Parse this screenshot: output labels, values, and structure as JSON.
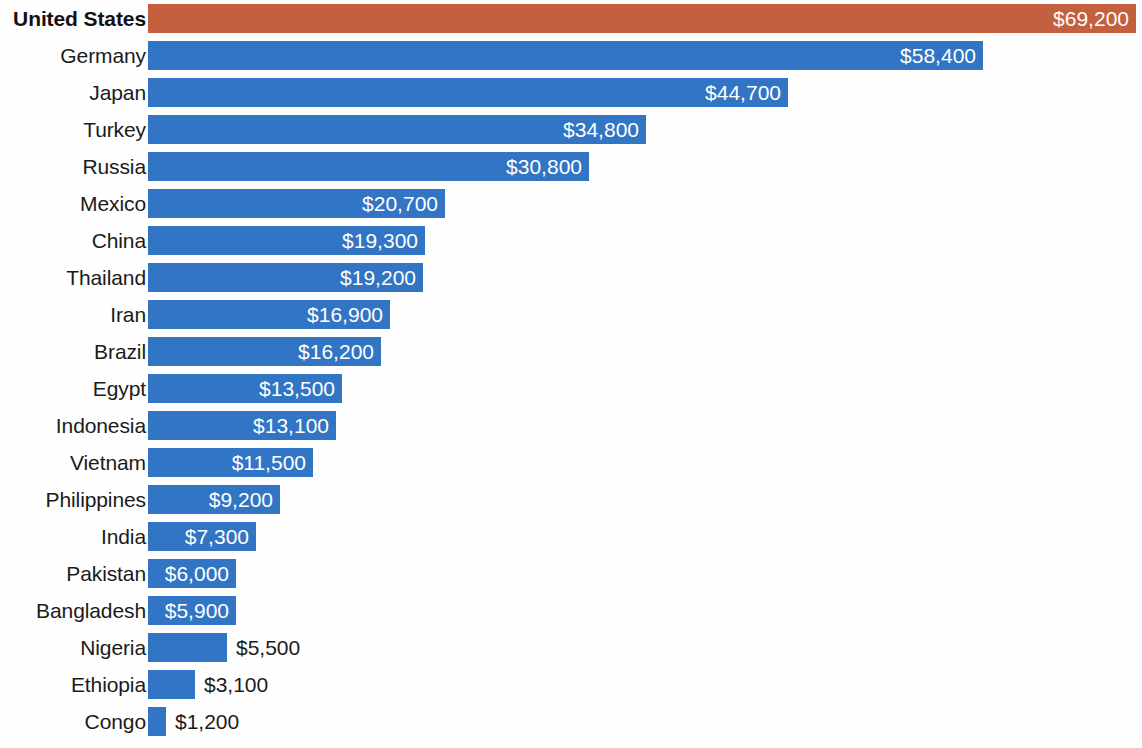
{
  "chart_data": {
    "type": "bar",
    "orientation": "horizontal",
    "title": "",
    "subtitle": "",
    "xlabel": "",
    "ylabel": "",
    "grid": false,
    "legend": null,
    "axis_visible": false,
    "value_prefix": "$",
    "xlim": [
      0,
      69200
    ],
    "colors": {
      "bar": "#3175c4",
      "highlight_bar": "#c5603f",
      "inside_label": "#ffffff",
      "outside_label": "#1b1b1b",
      "background": "#fefefe"
    },
    "highlight_category": "United States",
    "categories": [
      "United States",
      "Germany",
      "Japan",
      "Turkey",
      "Russia",
      "Mexico",
      "China",
      "Thailand",
      "Iran",
      "Brazil",
      "Egypt",
      "Indonesia",
      "Vietnam",
      "Philippines",
      "India",
      "Pakistan",
      "Bangladesh",
      "Nigeria",
      "Ethiopia",
      "Congo"
    ],
    "values": [
      69200,
      58400,
      44700,
      34800,
      30800,
      20700,
      19300,
      19200,
      16900,
      16200,
      13500,
      13100,
      11500,
      9200,
      7300,
      6000,
      5900,
      5500,
      3100,
      1200
    ],
    "value_labels": [
      "$69,200",
      "$58,400",
      "$44,700",
      "$34,800",
      "$30,800",
      "$20,700",
      "$19,300",
      "$19,200",
      "$16,900",
      "$16,200",
      "$13,500",
      "$13,100",
      "$11,500",
      "$9,200",
      "$7,300",
      "$6,000",
      "$5,900",
      "$5,500",
      "$3,100",
      "$1,200"
    ]
  },
  "rows": [
    {
      "label": "United States",
      "value": 69200,
      "value_label": "$69,200",
      "bar_px": 988,
      "label_inside": true,
      "highlight": true
    },
    {
      "label": "Germany",
      "value": 58400,
      "value_label": "$58,400",
      "bar_px": 835,
      "label_inside": true,
      "highlight": false
    },
    {
      "label": "Japan",
      "value": 44700,
      "value_label": "$44,700",
      "bar_px": 640,
      "label_inside": true,
      "highlight": false
    },
    {
      "label": "Turkey",
      "value": 34800,
      "value_label": "$34,800",
      "bar_px": 498,
      "label_inside": true,
      "highlight": false
    },
    {
      "label": "Russia",
      "value": 30800,
      "value_label": "$30,800",
      "bar_px": 441,
      "label_inside": true,
      "highlight": false
    },
    {
      "label": "Mexico",
      "value": 20700,
      "value_label": "$20,700",
      "bar_px": 297,
      "label_inside": true,
      "highlight": false
    },
    {
      "label": "China",
      "value": 19300,
      "value_label": "$19,300",
      "bar_px": 277,
      "label_inside": true,
      "highlight": false
    },
    {
      "label": "Thailand",
      "value": 19200,
      "value_label": "$19,200",
      "bar_px": 275,
      "label_inside": true,
      "highlight": false
    },
    {
      "label": "Iran",
      "value": 16900,
      "value_label": "$16,900",
      "bar_px": 242,
      "label_inside": true,
      "highlight": false
    },
    {
      "label": "Brazil",
      "value": 16200,
      "value_label": "$16,200",
      "bar_px": 233,
      "label_inside": true,
      "highlight": false
    },
    {
      "label": "Egypt",
      "value": 13500,
      "value_label": "$13,500",
      "bar_px": 194,
      "label_inside": true,
      "highlight": false
    },
    {
      "label": "Indonesia",
      "value": 13100,
      "value_label": "$13,100",
      "bar_px": 188,
      "label_inside": true,
      "highlight": false
    },
    {
      "label": "Vietnam",
      "value": 11500,
      "value_label": "$11,500",
      "bar_px": 165,
      "label_inside": true,
      "highlight": false
    },
    {
      "label": "Philippines",
      "value": 9200,
      "value_label": "$9,200",
      "bar_px": 132,
      "label_inside": true,
      "highlight": false
    },
    {
      "label": "India",
      "value": 7300,
      "value_label": "$7,300",
      "bar_px": 108,
      "label_inside": true,
      "highlight": false
    },
    {
      "label": "Pakistan",
      "value": 6000,
      "value_label": "$6,000",
      "bar_px": 88,
      "label_inside": true,
      "highlight": false
    },
    {
      "label": "Bangladesh",
      "value": 5900,
      "value_label": "$5,900",
      "bar_px": 88,
      "label_inside": true,
      "highlight": false
    },
    {
      "label": "Nigeria",
      "value": 5500,
      "value_label": "$5,500",
      "bar_px": 79,
      "label_inside": false,
      "highlight": false
    },
    {
      "label": "Ethiopia",
      "value": 3100,
      "value_label": "$3,100",
      "bar_px": 47,
      "label_inside": false,
      "highlight": false
    },
    {
      "label": "Congo",
      "value": 1200,
      "value_label": "$1,200",
      "bar_px": 18,
      "label_inside": false,
      "highlight": false
    }
  ]
}
